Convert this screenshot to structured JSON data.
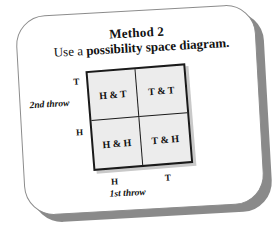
{
  "card": {
    "title": "Method 2",
    "subtitle_prefix": "Use a ",
    "subtitle_emphasis": "possibility space diagram."
  },
  "diagram": {
    "y_axis_title": "2nd throw",
    "x_axis_title": "1st throw",
    "y_ticks": [
      "T",
      "H"
    ],
    "x_ticks": [
      "H",
      "T"
    ],
    "cells": [
      [
        "H & T",
        "T & T"
      ],
      [
        "H & H",
        "T & H"
      ]
    ]
  },
  "colors": {
    "cell_fill": "#ececec",
    "grid_border": "#1a1a1a",
    "card_border": "#8c8c8c",
    "card_shadow": "#8a8a8a",
    "text": "#111111"
  },
  "chart_data": {
    "type": "table",
    "title": "Method 2",
    "subtitle": "Use a possibility space diagram.",
    "xlabel": "1st throw",
    "ylabel": "2nd throw",
    "columns": [
      "H",
      "T"
    ],
    "rows": [
      "T",
      "H"
    ],
    "values": [
      [
        "H & T",
        "T & T"
      ],
      [
        "H & H",
        "T & H"
      ]
    ],
    "grid": true,
    "legend": "none"
  }
}
